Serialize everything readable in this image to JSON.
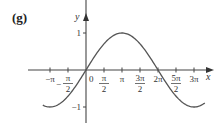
{
  "panel_label": "(g)",
  "chart_data": {
    "type": "line",
    "title": "",
    "function_depicted": "y = sin(x/2)",
    "xlabel": "x",
    "ylabel": "y",
    "xlim": [
      -3.8,
      10.5
    ],
    "ylim": [
      -1.15,
      1.15
    ],
    "grid": false,
    "legend": null,
    "x_ticks": [
      {
        "value": -3.14159,
        "label": "−π",
        "num": "−π",
        "den": ""
      },
      {
        "value": -1.5708,
        "label": "−π/2",
        "num": "π",
        "den": "2",
        "neg": true
      },
      {
        "value": 1.5708,
        "label": "π/2",
        "num": "π",
        "den": "2"
      },
      {
        "value": 3.14159,
        "label": "π",
        "num": "π",
        "den": ""
      },
      {
        "value": 4.71239,
        "label": "3π/2",
        "num": "3π",
        "den": "2"
      },
      {
        "value": 6.28319,
        "label": "2π",
        "num": "2π",
        "den": ""
      },
      {
        "value": 7.85398,
        "label": "5π/2",
        "num": "5π",
        "den": "2"
      },
      {
        "value": 9.42478,
        "label": "3π",
        "num": "3π",
        "den": ""
      }
    ],
    "y_ticks": [
      {
        "value": 1,
        "label": "1"
      },
      {
        "value": -1,
        "label": "−1"
      }
    ],
    "origin_label": "0",
    "series": [
      {
        "name": "sin(x/2)",
        "color": "#555555",
        "x": [
          -3.77,
          -3.14159,
          -1.5708,
          0,
          1.5708,
          3.14159,
          4.71239,
          6.28319,
          7.85398,
          9.42478,
          10.37
        ],
        "y": [
          -0.951,
          -1.0,
          -0.707,
          0,
          0.707,
          1.0,
          0.707,
          0,
          -0.707,
          -1.0,
          -0.928
        ]
      }
    ]
  }
}
